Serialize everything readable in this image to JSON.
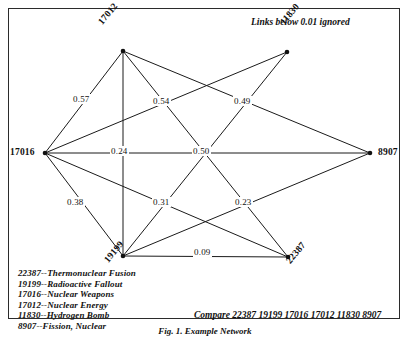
{
  "figure": {
    "note_top_right": "Links below 0.01 ignored",
    "note_bottom_right": "Compare 22387 19199 17016 17012 11830 8907",
    "caption": "Fig. 1. Example Network",
    "line_color": "#1a1a1a",
    "background": "#ffffff"
  },
  "nodes": [
    {
      "id": "17012",
      "label": "17012",
      "x": 123,
      "y": 51,
      "label_x": 96,
      "label_y": 20,
      "rotation": -50
    },
    {
      "id": "11830",
      "label": "11830",
      "x": 287,
      "y": 52,
      "label_x": 278,
      "label_y": 20,
      "rotation": -50
    },
    {
      "id": "17016",
      "label": "17016",
      "x": 45,
      "y": 153,
      "label_x": 10,
      "label_y": 147,
      "rotation": 0
    },
    {
      "id": "8907",
      "label": "8907",
      "x": 370,
      "y": 153,
      "label_x": 378,
      "label_y": 147,
      "rotation": 0
    },
    {
      "id": "19199",
      "label": "19199",
      "x": 123,
      "y": 256,
      "label_x": 102,
      "label_y": 258,
      "rotation": -50
    },
    {
      "id": "22387",
      "label": "22387",
      "x": 288,
      "y": 257,
      "label_x": 284,
      "label_y": 259,
      "rotation": -50
    }
  ],
  "edges": [
    {
      "from": "17012",
      "to": "17016",
      "weight": "0.57",
      "label_x": 72,
      "label_y": 94
    },
    {
      "from": "17012",
      "to": "19199",
      "weight": "",
      "label_x": 0,
      "label_y": 0
    },
    {
      "from": "17012",
      "to": "22387",
      "weight": "0.54",
      "label_x": 152,
      "label_y": 96
    },
    {
      "from": "17012",
      "to": "8907",
      "weight": "",
      "label_x": 0,
      "label_y": 0
    },
    {
      "from": "11830",
      "to": "17016",
      "weight": "",
      "label_x": 0,
      "label_y": 0
    },
    {
      "from": "11830",
      "to": "19199",
      "weight": "0.49",
      "label_x": 233,
      "label_y": 96
    },
    {
      "from": "17016",
      "to": "8907",
      "weight": "0.24",
      "label_x": 110,
      "label_y": 146
    },
    {
      "from": "17016",
      "to": "19199",
      "weight": "0.38",
      "label_x": 66,
      "label_y": 197
    },
    {
      "from": "17016",
      "to": "22387",
      "weight": "",
      "label_x": 0,
      "label_y": 0
    },
    {
      "from": "19199",
      "to": "22387",
      "weight": "0.09",
      "label_x": 193,
      "label_y": 247
    },
    {
      "from": "19199",
      "to": "8907",
      "weight": "",
      "label_x": 0,
      "label_y": 0
    }
  ],
  "crossing_labels": [
    {
      "weight": "0.50",
      "label_x": 192,
      "label_y": 146
    },
    {
      "weight": "0.31",
      "label_x": 152,
      "label_y": 197
    },
    {
      "weight": "0.23",
      "label_x": 234,
      "label_y": 197
    }
  ],
  "legend": {
    "items": [
      "22387--Thermonuclear Fusion",
      "19199--Radioactive Fallout",
      "17016--Nuclear Weapons",
      "17012--Nuclear Energy",
      "11830--Hydrogen Bomb",
      "8907--Fission, Nuclear"
    ]
  }
}
